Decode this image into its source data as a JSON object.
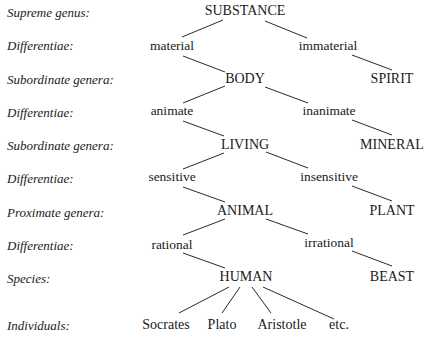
{
  "diagram": {
    "type": "Tree of Porphyry",
    "level_labels": [
      "Supreme genus:",
      "Differentiae:",
      "Subordinate genera:",
      "Differentiae:",
      "Subordinate genera:",
      "Differentiae:",
      "Proximate genera:",
      "Differentiae:",
      "Species:",
      "Individuals:"
    ],
    "nodes": {
      "substance": "SUBSTANCE",
      "material": "material",
      "immaterial": "immaterial",
      "body": "BODY",
      "spirit": "SPIRIT",
      "animate": "animate",
      "inanimate": "inanimate",
      "living": "LIVING",
      "mineral": "MINERAL",
      "sensitive": "sensitive",
      "insensitive": "insensitive",
      "animal": "ANIMAL",
      "plant": "PLANT",
      "rational": "rational",
      "irrational": "irrational",
      "human": "HUMAN",
      "beast": "BEAST",
      "individuals": [
        "Socrates",
        "Plato",
        "Aristotle",
        "etc."
      ]
    },
    "edges": [
      [
        "SUBSTANCE",
        "material"
      ],
      [
        "SUBSTANCE",
        "immaterial"
      ],
      [
        "material",
        "BODY"
      ],
      [
        "immaterial",
        "SPIRIT"
      ],
      [
        "BODY",
        "animate"
      ],
      [
        "BODY",
        "inanimate"
      ],
      [
        "animate",
        "LIVING"
      ],
      [
        "inanimate",
        "MINERAL"
      ],
      [
        "LIVING",
        "sensitive"
      ],
      [
        "LIVING",
        "insensitive"
      ],
      [
        "sensitive",
        "ANIMAL"
      ],
      [
        "insensitive",
        "PLANT"
      ],
      [
        "ANIMAL",
        "rational"
      ],
      [
        "ANIMAL",
        "irrational"
      ],
      [
        "rational",
        "HUMAN"
      ],
      [
        "irrational",
        "BEAST"
      ],
      [
        "HUMAN",
        "Socrates"
      ],
      [
        "HUMAN",
        "Plato"
      ],
      [
        "HUMAN",
        "Aristotle"
      ],
      [
        "HUMAN",
        "etc."
      ]
    ]
  }
}
